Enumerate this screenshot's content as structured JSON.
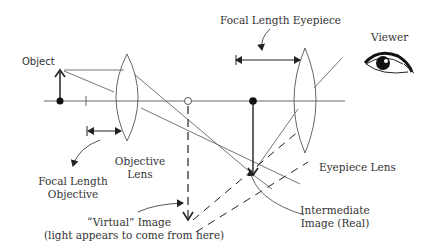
{
  "diagram": {
    "colors": {
      "line": "#555555",
      "thin": "#777777",
      "ink": "#222222",
      "background": "#ffffff"
    },
    "labels": {
      "object": "Object",
      "focal_length_eyepiece": "Focal Length Eyepiece",
      "viewer": "Viewer",
      "objective_lens_line1": "Objective",
      "objective_lens_line2": "Lens",
      "focal_length_objective_line1": "Focal Length",
      "focal_length_objective_line2": "Objective",
      "eyepiece_lens": "Eyepiece Lens",
      "virtual_image_line1": "“Virtual” Image",
      "virtual_image_line2": "(light appears to come from here)",
      "intermediate_image_line1": "Intermediate",
      "intermediate_image_line2": "Image (Real)"
    },
    "elements": {
      "optical_axis": {
        "x1": 44,
        "x2": 345,
        "y": 101
      },
      "object_arrow": {
        "x": 60,
        "y_base": 101,
        "y_tip": 70
      },
      "objective_lens": {
        "cx": 127,
        "top": 54,
        "bottom": 141,
        "half_width": 11
      },
      "eyepiece_lens": {
        "cx": 313,
        "top": 48,
        "bottom": 153,
        "half_width": 12
      },
      "objective_focal_point": {
        "x": 188,
        "y": 101
      },
      "intermediate_image": {
        "x": 253,
        "y_base": 101,
        "y_tip": 176
      },
      "virtual_image": {
        "x": 188,
        "y_base": 105,
        "y_tip": 222
      }
    }
  }
}
